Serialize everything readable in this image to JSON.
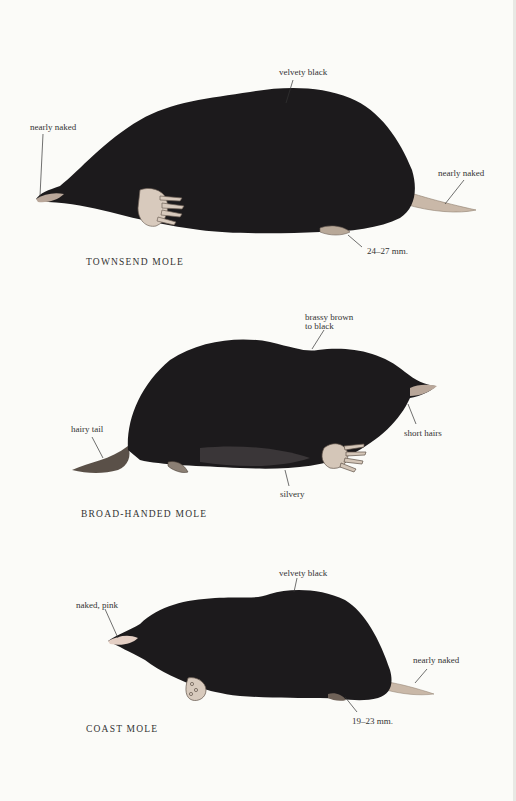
{
  "page": {
    "background": "#fbfbf8",
    "ink": "#2a2a2a",
    "fur_color": "#1c1a1c"
  },
  "plates": [
    {
      "caption": "TOWNSEND MOLE",
      "labels": {
        "back": "velvety black",
        "snout": "nearly naked",
        "tail": "nearly naked",
        "foot": "24–27 mm."
      }
    },
    {
      "caption": "BROAD-HANDED MOLE",
      "labels": {
        "back_line1": "brassy brown",
        "back_line2": "to black",
        "tail": "hairy tail",
        "snout": "short hairs",
        "belly": "silvery"
      }
    },
    {
      "caption": "COAST MOLE",
      "labels": {
        "back": "velvety black",
        "snout": "naked, pink",
        "tail": "nearly naked",
        "foot": "19–23 mm."
      }
    }
  ]
}
